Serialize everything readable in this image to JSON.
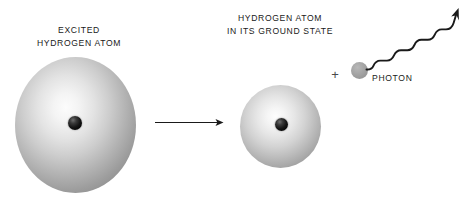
{
  "figure": {
    "background_color": "#ffffff",
    "width": 472,
    "height": 201
  },
  "labels": {
    "excited_atom": "EXCITED\nHYDROGEN ATOM",
    "excited_atom_line1": "EXCITED",
    "excited_atom_line2": "HYDROGEN ATOM",
    "ground_atom": "HYDROGEN ATOM\nIN ITS GROUND STATE",
    "ground_atom_line1": "HYDROGEN ATOM",
    "ground_atom_line2": "IN ITS GROUND STATE",
    "photon": "PHOTON",
    "plus": "+"
  },
  "objects": {
    "excited_atom": {
      "name": "excited-hydrogen-atom",
      "shape": "sphere",
      "center_x": 75,
      "center_y": 125,
      "diameter": 121,
      "fill_style": "radial-gradient-light-center",
      "edge_color": "#878787",
      "highlight_color": "#fcfcfc"
    },
    "excited_atom_nucleus": {
      "name": "nucleus",
      "shape": "sphere",
      "center_x": 75,
      "center_y": 123,
      "diameter": 14,
      "color": "#0c0c0c"
    },
    "ground_atom": {
      "name": "ground-state-hydrogen-atom",
      "shape": "sphere",
      "center_x": 280,
      "center_y": 126,
      "diameter": 81,
      "fill_style": "radial-gradient-light-center",
      "edge_color": "#8f8f8f",
      "highlight_color": "#fdfdfd"
    },
    "ground_atom_nucleus": {
      "name": "nucleus",
      "shape": "sphere",
      "center_x": 281,
      "center_y": 124,
      "diameter": 13,
      "color": "#0c0c0c"
    },
    "photon_particle": {
      "name": "photon-particle",
      "shape": "sphere",
      "center_x": 359,
      "center_y": 70,
      "diameter": 17,
      "color": "#a3a3a3"
    },
    "transition_arrow": {
      "name": "transition-arrow",
      "shape": "straight-arrow",
      "from_x": 155,
      "from_y": 122,
      "to_x": 223,
      "to_y": 122,
      "color": "#1a1a1a"
    },
    "photon_wave": {
      "name": "photon-wave-arrow",
      "shape": "wavy-arrow",
      "from_x": 368,
      "from_y": 68,
      "to_x": 459,
      "to_y": 9,
      "color": "#1a1a1a",
      "wave_cycles": 4
    }
  },
  "colors": {
    "text": "#1a1a1a",
    "stroke": "#1a1a1a",
    "sphere_light": "#fcfcfc",
    "sphere_dark": "#828282",
    "nucleus": "#0c0c0c",
    "photon": "#a3a3a3",
    "background": "#ffffff"
  }
}
